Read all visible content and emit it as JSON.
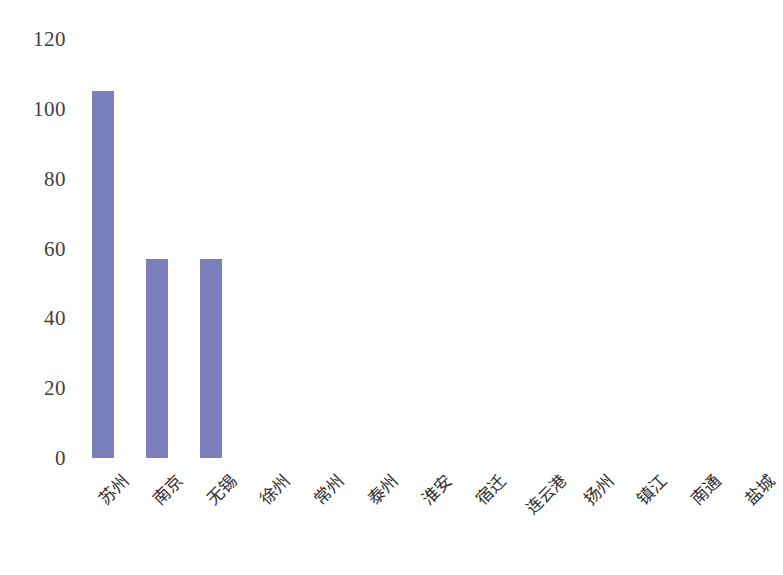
{
  "chart_data": {
    "type": "bar",
    "title": "",
    "subtitle": "",
    "xlabel": "",
    "ylabel": "",
    "categories": [
      "苏州",
      "南京",
      "无锡",
      "徐州",
      "常州",
      "泰州",
      "淮安",
      "宿迁",
      "连云港",
      "扬州",
      "镇江",
      "南通",
      "盐城"
    ],
    "values": [
      105,
      57,
      57,
      0,
      0,
      0,
      0,
      0,
      0,
      0,
      0,
      0,
      0
    ],
    "ylim": [
      0,
      120
    ],
    "ytick_labels": [
      "120",
      "100",
      "80",
      "60",
      "40",
      "20",
      "0"
    ],
    "ytick_values": [
      120,
      100,
      80,
      60,
      40,
      20,
      0
    ],
    "ytick_step": 20,
    "grid": false,
    "axis_line": false,
    "legend": false,
    "legend_position": "none",
    "bar_color": "#7b80bd",
    "background_color": "#ffffff",
    "tick_label_color": "#3f3f3f",
    "category_label_rotation": -45,
    "annotations": []
  }
}
